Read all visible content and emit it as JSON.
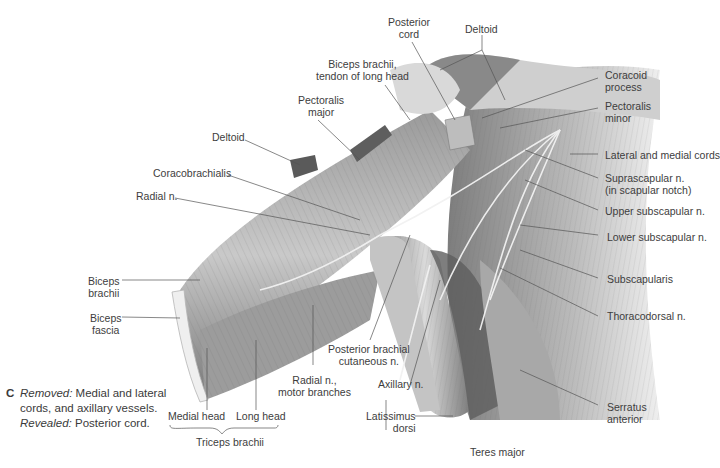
{
  "figure": {
    "panel_letter": "C",
    "caption": {
      "removed_label": "Removed:",
      "removed_text": " Medial and lateral cords, and axillary vessels. ",
      "revealed_label": "Revealed:",
      "revealed_text": " Posterior cord."
    },
    "colors": {
      "background": "#ffffff",
      "label_text": "#3d3d3d",
      "leader_line": "#555555",
      "muscle_dark": "#6a6a6a",
      "muscle_light": "#d8d8d8"
    },
    "labels": {
      "posterior_cord": [
        "Posterior",
        "cord"
      ],
      "deltoid_top": [
        "Deltoid"
      ],
      "biceps_tendon": [
        "Biceps brachii,",
        "tendon of long head"
      ],
      "pectoralis_major": [
        "Pectoralis",
        "major"
      ],
      "deltoid_left": [
        "Deltoid"
      ],
      "coracobrachialis": [
        "Coracobrachialis"
      ],
      "radial_n": [
        "Radial n."
      ],
      "coracoid_process": [
        "Coracoid",
        "process"
      ],
      "pectoralis_minor": [
        "Pectoralis",
        "minor"
      ],
      "lateral_medial_cords": [
        "Lateral and medial cords"
      ],
      "suprascapular_n": [
        "Suprascapular n.",
        "(in scapular notch)"
      ],
      "upper_subscapular_n": [
        "Upper subscapular n."
      ],
      "lower_subscapular_n": [
        "Lower subscapular n."
      ],
      "subscapularis": [
        "Subscapularis"
      ],
      "thoracodorsal_n": [
        "Thoracodorsal n."
      ],
      "serratus_anterior": [
        "Serratus",
        "anterior"
      ],
      "biceps_brachii": [
        "Biceps",
        "brachii"
      ],
      "biceps_fascia": [
        "Biceps",
        "fascia"
      ],
      "posterior_brachial_cutaneous_n": [
        "Posterior brachial",
        "cutaneous n."
      ],
      "radial_n_motor": [
        "Radial n.,",
        "motor branches"
      ],
      "axillary_n": [
        "Axillary n."
      ],
      "latissimus_dorsi": [
        "Latissimus",
        "dorsi"
      ],
      "teres_major": [
        "Teres major"
      ],
      "medial_head": [
        "Medial head"
      ],
      "long_head": [
        "Long head"
      ],
      "triceps_brachii": [
        "Triceps brachii"
      ]
    }
  }
}
